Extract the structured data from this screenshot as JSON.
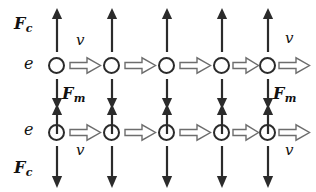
{
  "diagram": {
    "type": "physics-force-diagram",
    "stroke_color": "#2b2b2b",
    "background_color": "#ffffff",
    "labels": {
      "electron": "e",
      "velocity": "v",
      "coulomb_force": "F",
      "coulomb_force_sub": "c",
      "magnetic_force": "F",
      "magnetic_force_sub": "m"
    },
    "rows": [
      {
        "name": "top-beam",
        "electron_label": "e",
        "particle_count": 5,
        "velocity_label": "v",
        "velocity_direction": "right",
        "up_arrow_count": 5,
        "down_arrow_count": 5,
        "block_arrow_count": 5
      },
      {
        "name": "bottom-beam",
        "electron_label": "e",
        "particle_count": 5,
        "velocity_label": "v",
        "velocity_direction": "right",
        "up_arrow_count": 5,
        "down_arrow_count": 5,
        "block_arrow_count": 5
      }
    ],
    "force_labels": [
      {
        "name": "coulomb-top-left",
        "text": "F",
        "sub": "c"
      },
      {
        "name": "coulomb-bottom-left",
        "text": "F",
        "sub": "c"
      },
      {
        "name": "magnetic-left",
        "text": "F",
        "sub": "m"
      },
      {
        "name": "magnetic-right",
        "text": "F",
        "sub": "m"
      }
    ],
    "velocity_labels": [
      {
        "name": "velocity-top-left",
        "text": "v"
      },
      {
        "name": "velocity-top-right",
        "text": "v"
      },
      {
        "name": "velocity-bottom-left",
        "text": "v"
      },
      {
        "name": "velocity-bottom-right",
        "text": "v"
      }
    ],
    "electron_labels": [
      {
        "name": "electron-label-top",
        "text": "e"
      },
      {
        "name": "electron-label-bottom",
        "text": "e"
      }
    ]
  }
}
